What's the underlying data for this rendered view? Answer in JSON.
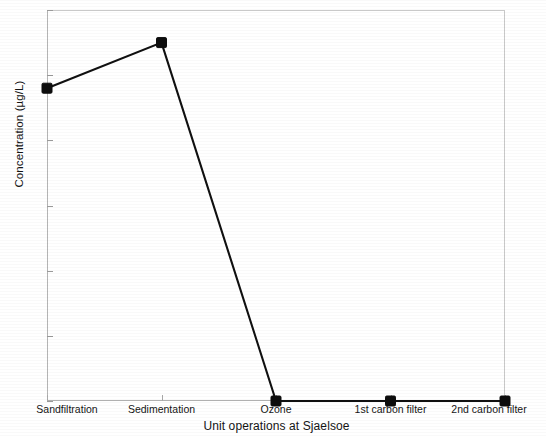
{
  "chart_data": {
    "type": "line",
    "title": "",
    "xlabel": "Unit operations at Sjaelsoe",
    "ylabel": "Concentration (µg/L)",
    "categories": [
      "Sandfiltration",
      "Sedimentation",
      "Ozone",
      "1st carbon filter",
      "2nd carbon filter"
    ],
    "values": [
      48,
      55,
      0,
      0,
      0
    ],
    "series": [
      {
        "name": "Concentration",
        "values": [
          48,
          55,
          0,
          0,
          0
        ],
        "marker": "filled-square",
        "color": "#101010"
      }
    ],
    "ylim": [
      0,
      60
    ],
    "yticks": [
      0,
      10,
      20,
      30,
      40,
      50,
      60
    ],
    "ytick_labels": [
      "0",
      "10",
      "20",
      "30",
      "40",
      "50",
      "60"
    ],
    "xtick_labels": [
      "Sandfiltration",
      "Sedimentation",
      "Ozone",
      "1st carbon filter",
      "2nd carbon filter"
    ],
    "grid": false,
    "legend": null,
    "legend_position": "none",
    "line_color": "#101010",
    "marker_color": "#0d0d0d",
    "background_color": "#ffffff",
    "axis_color": "#b8b8b8"
  },
  "axes": {
    "y_title": "Concentration (µg/L)",
    "x_title": "Unit operations at Sjaelsoe"
  }
}
